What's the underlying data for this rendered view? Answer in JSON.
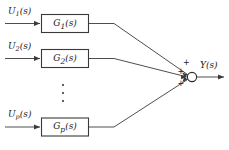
{
  "diagram": {
    "type": "block-diagram",
    "line_color": "#3a3a3a",
    "block_fill": "#ffffff",
    "block_stroke": "#3a3a3a",
    "text_color": "#1a1a1a",
    "inputs": [
      {
        "label": "U",
        "sub": "1",
        "suffix": "(s)"
      },
      {
        "label": "U",
        "sub": "2",
        "suffix": "(s)"
      },
      {
        "label": "U",
        "sub": "p",
        "suffix": "(s)"
      }
    ],
    "blocks": [
      {
        "label": "G",
        "sub": "1",
        "suffix": "(s)"
      },
      {
        "label": "G",
        "sub": "2",
        "suffix": "(s)"
      },
      {
        "label": "G",
        "sub": "p",
        "suffix": "(s)"
      }
    ],
    "summing_junction": {
      "name": "summing-junction",
      "signs": [
        "+",
        "+",
        "+"
      ]
    },
    "output": {
      "label": "Y",
      "suffix": "(s)"
    },
    "ellipsis": "vertical-dots"
  }
}
